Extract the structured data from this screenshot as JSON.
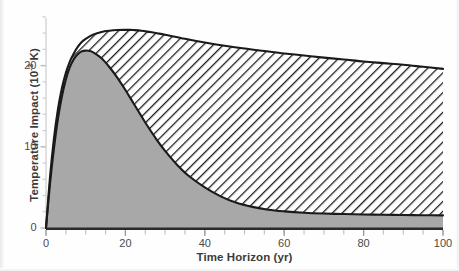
{
  "figure": {
    "background_color": "#fefefe",
    "plot_area": {
      "x0": 46,
      "x1": 443,
      "y_top": 18,
      "y_bottom": 228
    }
  },
  "chart_data": {
    "type": "area",
    "title": "",
    "subtitle": "",
    "xlabel": "Time Horizon (yr)",
    "ylabel_text": "Temperature Impact (10",
    "ylabel_exponent": "-3",
    "ylabel_tail": " K)",
    "ylabel": "Temperature Impact (10^-3 K)",
    "xlim": [
      0,
      100
    ],
    "ylim": [
      0,
      26
    ],
    "xticks": [
      0,
      20,
      40,
      60,
      80,
      100
    ],
    "xtick_labels": [
      "0",
      "20",
      "40",
      "60",
      "80",
      "100"
    ],
    "yticks": [
      0,
      10,
      20
    ],
    "ytick_labels": [
      "0",
      "10",
      "20"
    ],
    "minor_xtick_interval": 5,
    "minor_ytick_interval": 2,
    "grid": false,
    "legend": null,
    "axis_color": "#cfcfcf",
    "curve_line_color": "#1a1a1a",
    "series": [
      {
        "name": "upper-hatched-curve",
        "fill_style": "diagonal-hatch",
        "fill_color": "#ffffff",
        "hatch_color": "#1d1d1d",
        "x": [
          0,
          1,
          2,
          3,
          4,
          5,
          6,
          7,
          8,
          9,
          10,
          12,
          14,
          16,
          18,
          20,
          21,
          22,
          24,
          26,
          28,
          30,
          35,
          40,
          45,
          50,
          55,
          60,
          65,
          70,
          75,
          80,
          85,
          90,
          95,
          100
        ],
        "values": [
          0,
          6.2,
          11.0,
          14.6,
          17.2,
          19.1,
          20.5,
          21.5,
          22.3,
          22.9,
          23.3,
          23.85,
          24.15,
          24.3,
          24.38,
          24.4,
          24.4,
          24.38,
          24.3,
          24.15,
          23.98,
          23.8,
          23.3,
          22.85,
          22.45,
          22.1,
          21.8,
          21.5,
          21.25,
          20.98,
          20.75,
          20.5,
          20.3,
          20.1,
          19.85,
          19.6
        ]
      },
      {
        "name": "lower-gray-curve",
        "fill_style": "solid",
        "fill_color": "#a8a8a8",
        "hatch_color": null,
        "x": [
          0,
          1,
          2,
          3,
          4,
          5,
          6,
          7,
          8,
          9,
          10,
          11,
          12,
          14,
          16,
          18,
          20,
          22,
          25,
          28,
          30,
          33,
          36,
          40,
          44,
          48,
          52,
          56,
          60,
          65,
          70,
          75,
          80,
          85,
          90,
          95,
          100
        ],
        "values": [
          0,
          5.4,
          9.8,
          13.4,
          16.2,
          18.3,
          19.8,
          20.8,
          21.4,
          21.75,
          21.85,
          21.8,
          21.6,
          20.9,
          19.8,
          18.5,
          17.0,
          15.4,
          13.0,
          10.8,
          9.5,
          7.8,
          6.4,
          5.0,
          3.9,
          3.1,
          2.6,
          2.25,
          2.05,
          1.88,
          1.78,
          1.72,
          1.67,
          1.63,
          1.6,
          1.57,
          1.55
        ]
      }
    ],
    "peak_annotations": {
      "upper_peak_x": 20,
      "upper_peak_y": 24.4,
      "lower_peak_x": 10,
      "lower_peak_y": 21.85,
      "upper_end_y": 19.6,
      "lower_end_y": 1.55
    }
  }
}
